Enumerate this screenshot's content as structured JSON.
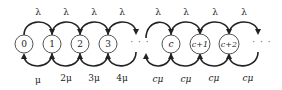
{
  "diagram": {
    "type": "birth-death Markov chain (M/M/c queue)",
    "states": [
      {
        "label": "0",
        "x": 24
      },
      {
        "label": "1",
        "x": 52
      },
      {
        "label": "2",
        "x": 80
      },
      {
        "label": "3",
        "x": 108
      },
      {
        "label": "c",
        "x": 171
      },
      {
        "label": "c+1",
        "x": 200
      },
      {
        "label": "c+2",
        "x": 229
      }
    ],
    "ellipsis": [
      {
        "label": "· · ·",
        "x": 140
      },
      {
        "label": "· · ·",
        "x": 262
      }
    ],
    "arrival_labels": [
      "λ",
      "λ",
      "λ",
      "λ",
      "λ",
      "λ",
      "λ",
      "λ"
    ],
    "arrival_label_x": [
      38,
      66,
      94,
      122,
      157,
      185,
      214,
      244
    ],
    "service_labels": [
      "μ",
      "2μ",
      "3μ",
      "4μ",
      "cμ",
      "cμ",
      "cμ",
      "cμ"
    ],
    "service_label_x": [
      38,
      66,
      94,
      122,
      157,
      185,
      214,
      244
    ],
    "colors": {
      "arrow": "#222222",
      "node_stroke": "#555555",
      "background": "#ffffff"
    }
  }
}
